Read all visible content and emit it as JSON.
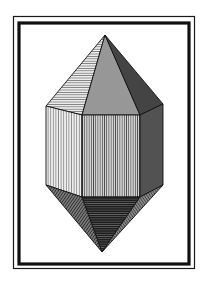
{
  "illustration": {
    "subject": "hexagonal bipyramidal crystal",
    "style": "engraving",
    "colors": {
      "background": "#ffffff",
      "ink": "#111111",
      "light_face": "#d9d9d9",
      "mid_face": "#a8a8a8",
      "dark_face": "#4a4a4a",
      "darkest_face": "#262626"
    },
    "frame": {
      "outer_rect": {
        "x": 13,
        "y": 16,
        "w": 182,
        "h": 253
      },
      "inner_rect": {
        "x": 18,
        "y": 22,
        "w": 172,
        "h": 243
      }
    },
    "crystal": {
      "top_apex": [
        105,
        35
      ],
      "bottom_apex": [
        102,
        252
      ],
      "prism_top": [
        [
          46,
          106
        ],
        [
          82,
          115
        ],
        [
          140,
          115
        ],
        [
          163,
          104
        ]
      ],
      "prism_bottom": [
        [
          46,
          185
        ],
        [
          82,
          197
        ],
        [
          140,
          197
        ],
        [
          163,
          185
        ]
      ]
    }
  }
}
